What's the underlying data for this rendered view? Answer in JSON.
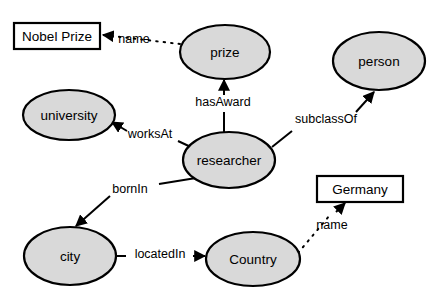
{
  "diagram": {
    "type": "knowledge-graph-schema",
    "background_color": "#ffffff",
    "class_node_fill": "#d9d9d9",
    "literal_node_fill": "#ffffff",
    "stroke_color": "#000000",
    "class_nodes": [
      {
        "id": "prize",
        "label": "prize",
        "cx": 225,
        "cy": 52,
        "rx": 45,
        "ry": 27
      },
      {
        "id": "person",
        "label": "person",
        "cx": 379,
        "cy": 61,
        "rx": 46,
        "ry": 29
      },
      {
        "id": "university",
        "label": "university",
        "cx": 69,
        "cy": 115,
        "rx": 46,
        "ry": 25
      },
      {
        "id": "researcher",
        "label": "researcher",
        "cx": 229,
        "cy": 160,
        "rx": 46,
        "ry": 28
      },
      {
        "id": "city",
        "label": "city",
        "cx": 70,
        "cy": 256,
        "rx": 46,
        "ry": 29
      },
      {
        "id": "country",
        "label": "Country",
        "cx": 253,
        "cy": 259,
        "rx": 47,
        "ry": 27
      }
    ],
    "literal_nodes": [
      {
        "id": "nobel-prize",
        "label": "Nobel Prize",
        "x": 14,
        "y": 23,
        "w": 86,
        "h": 26
      },
      {
        "id": "germany",
        "label": "Germany",
        "x": 317,
        "y": 176,
        "w": 86,
        "h": 26
      }
    ],
    "edges": [
      {
        "id": "prize-name-nobel",
        "label": "name",
        "style": "dotted",
        "from": "prize",
        "to": "nobel-prize",
        "label_x": 134,
        "label_y": 40
      },
      {
        "id": "researcher-hasaward",
        "label": "hasAward",
        "style": "solid",
        "from": "researcher",
        "to": "prize",
        "label_x": 223,
        "label_y": 103
      },
      {
        "id": "researcher-worksat",
        "label": "worksAt",
        "style": "solid",
        "from": "researcher",
        "to": "university",
        "label_x": 150,
        "label_y": 135
      },
      {
        "id": "researcher-subclassof",
        "label": "subclassOf",
        "style": "solid",
        "from": "researcher",
        "to": "person",
        "label_x": 326,
        "label_y": 120
      },
      {
        "id": "researcher-bornin",
        "label": "bornIn",
        "style": "solid",
        "from": "researcher",
        "to": "city",
        "label_x": 130,
        "label_y": 190
      },
      {
        "id": "city-locatedin",
        "label": "locatedIn",
        "style": "solid",
        "from": "city",
        "to": "country",
        "label_x": 160,
        "label_y": 255
      },
      {
        "id": "country-name-germany",
        "label": "name",
        "style": "dotted",
        "from": "country",
        "to": "germany",
        "label_x": 332,
        "label_y": 226
      }
    ]
  }
}
